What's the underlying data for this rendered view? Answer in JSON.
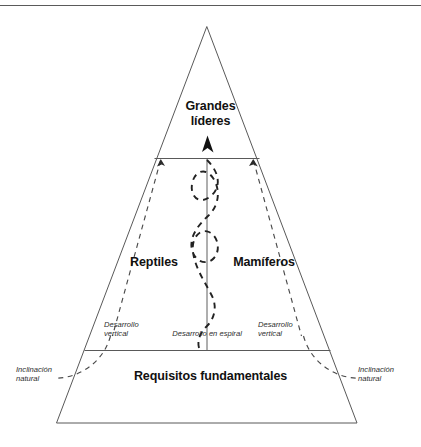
{
  "figure": {
    "type": "pyramid-diagram",
    "language": "es",
    "background_color": "#ffffff",
    "line_color": "#595959",
    "text_color": "#111111",
    "top_rule": {
      "name": "top-horizontal-rule",
      "color": "#5a5a5a"
    },
    "levels": [
      {
        "id": "apex",
        "label": "Grandes líderes",
        "label_line1": "Grandes",
        "label_line2": "líderes",
        "style": "bold"
      },
      {
        "id": "middle-left",
        "label": "Reptiles",
        "style": "bold"
      },
      {
        "id": "middle-right",
        "label": "Mamíferos",
        "style": "bold"
      },
      {
        "id": "base",
        "label": "Requisitos fundamentales",
        "style": "bold"
      }
    ],
    "annotations": [
      {
        "id": "desarrollo-vertical-left",
        "line1": "Desarrollo",
        "line2": "vertical",
        "style": "italic"
      },
      {
        "id": "desarrollo-espiral",
        "line1": "Desarrollo en espiral",
        "line2": "",
        "style": "italic"
      },
      {
        "id": "desarrollo-vertical-right",
        "line1": "Desarrollo",
        "line2": "vertical",
        "style": "italic"
      },
      {
        "id": "inclinacion-natural-left",
        "line1": "Inclinación",
        "line2": "natural",
        "style": "italic"
      },
      {
        "id": "inclinacion-natural-right",
        "line1": "Inclinación",
        "line2": "natural",
        "style": "italic"
      }
    ],
    "icons": [
      {
        "name": "arrow-up-icon",
        "position": "apex-divider-center"
      },
      {
        "name": "arrow-up-left-icon",
        "position": "left-dashed-top"
      },
      {
        "name": "arrow-up-right-icon",
        "position": "right-dashed-top"
      }
    ]
  }
}
